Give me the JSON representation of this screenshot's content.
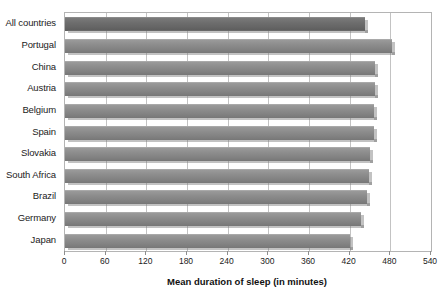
{
  "chart_data": {
    "type": "bar",
    "orientation": "horizontal",
    "title": "",
    "subtitle": "",
    "xlabel": "Mean duration of sleep (in minutes)",
    "ylabel": "",
    "xlim": [
      0,
      540
    ],
    "xticks": [
      0,
      60,
      120,
      180,
      240,
      300,
      360,
      420,
      480,
      540
    ],
    "xtick_labels": [
      "0",
      "60",
      "120",
      "180",
      "240",
      "300",
      "360",
      "420",
      "480",
      "540"
    ],
    "grid": true,
    "grid_axis": "x",
    "legend": false,
    "legend_position": "none",
    "categories": [
      "All countries",
      "Portugal",
      "China",
      "Austria",
      "Belgium",
      "Spain",
      "Slovakia",
      "South Africa",
      "Brazil",
      "Germany",
      "Japan"
    ],
    "values": [
      443,
      482,
      458,
      458,
      456,
      456,
      450,
      449,
      446,
      436,
      421
    ],
    "highlight_index": 0,
    "bar_color": "#8a8a8a",
    "highlight_color": "#6a6a6a",
    "grid_color": "#c3c3c3",
    "axis_color": "#b4b4b4",
    "text_color": "#1b1b1b"
  }
}
